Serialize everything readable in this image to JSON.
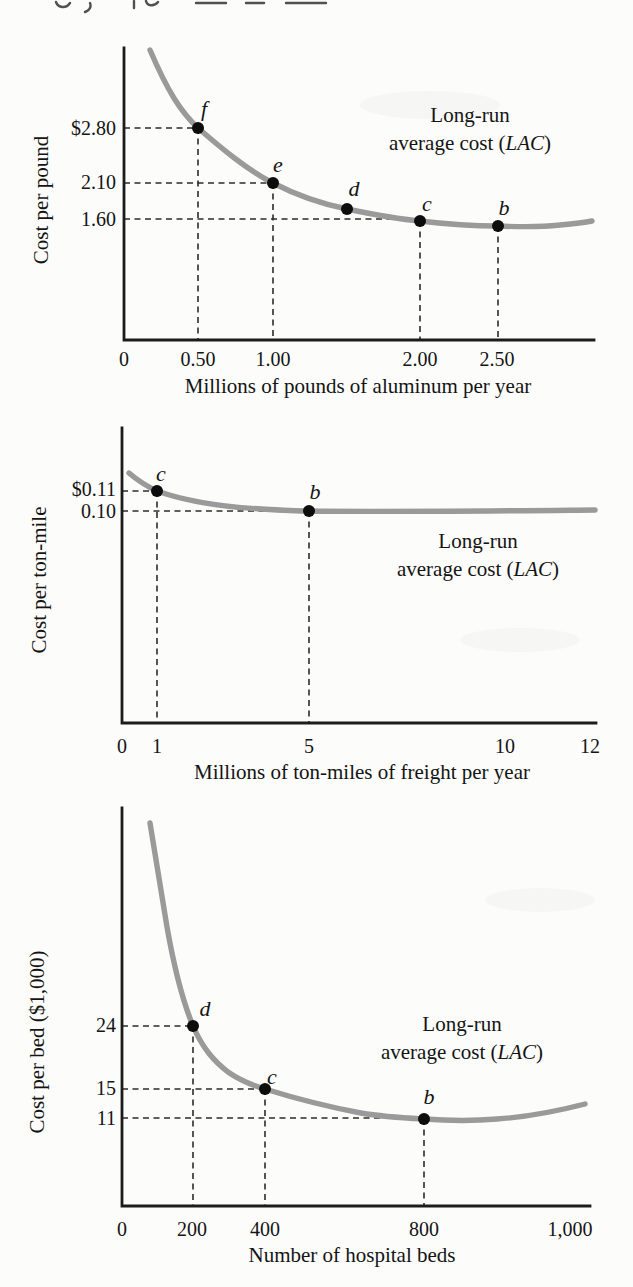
{
  "colors": {
    "curve": "#9a9a9a",
    "axis": "#1c1c1c",
    "text": "#141414",
    "dot": "#0d0d0d",
    "paper": "#fcfcfa"
  },
  "chart_data": [
    {
      "id": "aluminum",
      "type": "line",
      "series_label": "Long-run average cost (LAC)",
      "annotation_line1": "Long-run",
      "annotation_line2_parts": [
        "average cost (",
        "LAC",
        ")"
      ],
      "xlabel": "Millions of pounds of aluminum per year",
      "ylabel": "Cost per pound",
      "xlim": [
        0,
        2.9
      ],
      "x_tick_labels": [
        "0",
        "0.50",
        "1.00",
        "2.00",
        "2.50"
      ],
      "x_tick_values": [
        0,
        0.5,
        1.0,
        2.0,
        2.5
      ],
      "y_tick_labels": [
        "$2.80",
        "2.10",
        "1.60"
      ],
      "y_tick_values": [
        2.8,
        2.1,
        1.6
      ],
      "points": [
        {
          "label": "f",
          "x": 0.5,
          "y": 2.8
        },
        {
          "label": "e",
          "x": 1.0,
          "y": 2.1
        },
        {
          "label": "d",
          "x": 1.5,
          "y": 1.75
        },
        {
          "label": "c",
          "x": 2.0,
          "y": 1.6
        },
        {
          "label": "b",
          "x": 2.5,
          "y": 1.55
        }
      ]
    },
    {
      "id": "freight",
      "type": "line",
      "series_label": "Long-run average cost (LAC)",
      "annotation_line1": "Long-run",
      "annotation_line2_parts": [
        "average cost (",
        "LAC",
        ")"
      ],
      "xlabel": "Millions of ton-miles of freight per year",
      "ylabel": "Cost per ton-mile",
      "xlim": [
        0,
        12
      ],
      "x_tick_labels": [
        "0",
        "1",
        "5",
        "10",
        "12"
      ],
      "x_tick_values": [
        0,
        1,
        5,
        10,
        12
      ],
      "y_tick_labels": [
        "$0.11",
        "0.10"
      ],
      "y_tick_values": [
        0.11,
        0.1
      ],
      "points": [
        {
          "label": "c",
          "x": 1,
          "y": 0.11
        },
        {
          "label": "b",
          "x": 5,
          "y": 0.1
        }
      ]
    },
    {
      "id": "hospital",
      "type": "line",
      "series_label": "Long-run average cost (LAC)",
      "annotation_line1": "Long-run",
      "annotation_line2_parts": [
        "average cost (",
        "LAC",
        ")"
      ],
      "xlabel": "Number of hospital beds",
      "ylabel": "Cost per bed ($1,000)",
      "xlim": [
        0,
        1050
      ],
      "x_tick_labels": [
        "0",
        "200",
        "400",
        "800",
        "1,000"
      ],
      "x_tick_values": [
        0,
        200,
        400,
        800,
        1000
      ],
      "y_tick_labels": [
        "24",
        "15",
        "11"
      ],
      "y_tick_values": [
        24,
        15,
        11
      ],
      "points": [
        {
          "label": "d",
          "x": 200,
          "y": 24
        },
        {
          "label": "c",
          "x": 400,
          "y": 15
        },
        {
          "label": "b",
          "x": 800,
          "y": 11
        }
      ]
    }
  ],
  "render": {
    "top_marks_path": "M56,2 c2,6 10,7 14,1 M90,3 c2,5 -2,8 -5,9 M134,1 l0,7 M146,1 c1,5 8,6 12,1 M196,3 l30,0 M246,3 l18,0 M286,3 l40,0",
    "charts": [
      {
        "axes_path": "M594,340 L124,340 L124,48",
        "curve_path": "M150,50 C168,92 181,112 198,128 C220,147 247,170 273,183 C298,196 322,204 347,209 C371,214 397,219 420,221 C445,224 471,226 498,226 C520,227 542,227 560,225 C572,224 583,223 592,221",
        "dashes": [
          [
            124,
            128,
            198,
            128
          ],
          [
            124,
            183,
            273,
            183
          ],
          [
            124,
            219,
            420,
            219
          ],
          [
            198,
            128,
            198,
            340
          ],
          [
            273,
            183,
            273,
            340
          ],
          [
            420,
            221,
            420,
            340
          ],
          [
            498,
            226,
            498,
            340
          ]
        ],
        "points": [
          {
            "cx": 198,
            "cy": 128,
            "lx": 204,
            "ly": 116
          },
          {
            "cx": 273,
            "cy": 183,
            "lx": 278,
            "ly": 172
          },
          {
            "cx": 347,
            "cy": 209,
            "lx": 354,
            "ly": 196
          },
          {
            "cx": 420,
            "cy": 221,
            "lx": 427,
            "ly": 211
          },
          {
            "cx": 498,
            "cy": 226,
            "lx": 504,
            "ly": 215
          }
        ],
        "y_ticks": [
          {
            "x": 116,
            "y": 135
          },
          {
            "x": 116,
            "y": 189
          },
          {
            "x": 116,
            "y": 226
          }
        ],
        "x_ticks": [
          {
            "x": 124,
            "y": 366
          },
          {
            "x": 198,
            "y": 366
          },
          {
            "x": 273,
            "y": 366
          },
          {
            "x": 420,
            "y": 366
          },
          {
            "x": 497,
            "y": 366
          }
        ],
        "x_label": {
          "x": 358,
          "y": 393
        },
        "y_label": {
          "x": 48,
          "y": 200
        },
        "annotation": {
          "x": 470,
          "y1": 122,
          "y2": 150
        }
      },
      {
        "axes_path": "M596,723 L122,723 L122,428",
        "curve_path": "M129,473 C136,479 146,486 157,491 C185,501 225,507 262,509 C278,510 294,511 309,511 C380,512 480,511 595,510",
        "dashes": [
          [
            122,
            491,
            157,
            491
          ],
          [
            122,
            511,
            309,
            511
          ],
          [
            157,
            491,
            157,
            723
          ],
          [
            309,
            511,
            309,
            723
          ]
        ],
        "points": [
          {
            "cx": 157,
            "cy": 491,
            "lx": 161,
            "ly": 481
          },
          {
            "cx": 309,
            "cy": 511,
            "lx": 315,
            "ly": 499
          }
        ],
        "y_ticks": [
          {
            "x": 116,
            "y": 496
          },
          {
            "x": 116,
            "y": 518
          }
        ],
        "x_ticks": [
          {
            "x": 122,
            "y": 753
          },
          {
            "x": 157,
            "y": 753
          },
          {
            "x": 309,
            "y": 753
          },
          {
            "x": 505,
            "y": 753
          },
          {
            "x": 590,
            "y": 753
          }
        ],
        "x_label": {
          "x": 362,
          "y": 779
        },
        "y_label": {
          "x": 46,
          "y": 580
        },
        "annotation": {
          "x": 478,
          "y1": 548,
          "y2": 576
        }
      },
      {
        "axes_path": "M590,1206 L122,1206 L122,808",
        "curve_path": "M150,823 C156,858 161,892 167,927 C173,961 181,997 193,1026 C203,1049 214,1061 228,1072 C241,1081 251,1085 265,1089 C297,1099 329,1107 361,1113 C384,1117 405,1118 424,1119 C451,1121 474,1121 497,1119 C527,1117 558,1111 585,1104",
        "dashes": [
          [
            122,
            1026,
            193,
            1026
          ],
          [
            122,
            1089,
            265,
            1089
          ],
          [
            122,
            1118,
            424,
            1118
          ],
          [
            193,
            1026,
            193,
            1206
          ],
          [
            265,
            1089,
            265,
            1206
          ],
          [
            424,
            1119,
            424,
            1206
          ]
        ],
        "points": [
          {
            "cx": 193,
            "cy": 1026,
            "lx": 205,
            "ly": 1016
          },
          {
            "cx": 265,
            "cy": 1089,
            "lx": 272,
            "ly": 1084
          },
          {
            "cx": 424,
            "cy": 1119,
            "lx": 429,
            "ly": 1104
          }
        ],
        "y_ticks": [
          {
            "x": 116,
            "y": 1032
          },
          {
            "x": 116,
            "y": 1095
          },
          {
            "x": 116,
            "y": 1125
          }
        ],
        "x_ticks": [
          {
            "x": 122,
            "y": 1236
          },
          {
            "x": 192,
            "y": 1236
          },
          {
            "x": 265,
            "y": 1236
          },
          {
            "x": 424,
            "y": 1236
          },
          {
            "x": 570,
            "y": 1236
          }
        ],
        "x_label": {
          "x": 352,
          "y": 1262
        },
        "y_label": {
          "x": 44,
          "y": 1042
        },
        "annotation": {
          "x": 462,
          "y1": 1031,
          "y2": 1059
        }
      }
    ]
  }
}
